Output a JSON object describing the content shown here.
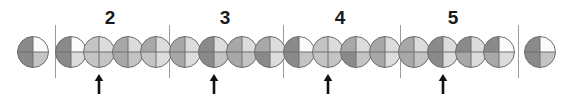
{
  "figure": {
    "width": 574,
    "height": 102,
    "background": "#ffffff"
  },
  "palette": {
    "outline": "#6e6e6e",
    "separator": "#9a9a9a",
    "arrow": "#111111",
    "label": "#1a1a1a",
    "shades": {
      "dark": "#8a8a8a",
      "mid": "#a8a8a8",
      "light": "#c4c4c4",
      "pale": "#dcdcdc",
      "white": "#fbfbfb"
    }
  },
  "geometry": {
    "circle_radius": 15.5,
    "circle_center_y": 52,
    "separator_top": 25,
    "separator_bottom": 78,
    "label_y": 8,
    "arrow_y": 74,
    "arrow_height": 20
  },
  "separators": [
    {
      "name": "separator-1",
      "x": 55
    },
    {
      "name": "separator-2",
      "x": 169
    },
    {
      "name": "separator-3",
      "x": 283
    },
    {
      "name": "separator-4",
      "x": 400
    },
    {
      "name": "separator-5",
      "x": 518
    }
  ],
  "group_labels": [
    {
      "name": "group-label-2",
      "text": "2",
      "x": 110
    },
    {
      "name": "group-label-3",
      "text": "3",
      "x": 225
    },
    {
      "name": "group-label-4",
      "text": "4",
      "x": 340
    },
    {
      "name": "group-label-5",
      "text": "5",
      "x": 453
    }
  ],
  "arrows": [
    {
      "name": "arrow-group-2",
      "x": 99,
      "glyph": "up-arrow"
    },
    {
      "name": "arrow-group-3",
      "x": 214,
      "glyph": "up-arrow"
    },
    {
      "name": "arrow-group-4",
      "x": 328,
      "glyph": "up-arrow"
    },
    {
      "name": "arrow-group-5",
      "x": 443,
      "glyph": "up-arrow"
    }
  ],
  "circles": [
    {
      "index": 1,
      "x": 33,
      "quadrants": {
        "tl": "#8a8a8a",
        "tr": "#fbfbfb",
        "br": "#c4c4c4",
        "bl": "#8a8a8a"
      }
    },
    {
      "index": 2,
      "x": 71,
      "quadrants": {
        "tl": "#8a8a8a",
        "tr": "#fbfbfb",
        "br": "#dcdcdc",
        "bl": "#8a8a8a"
      }
    },
    {
      "index": 3,
      "x": 99,
      "quadrants": {
        "tl": "#c4c4c4",
        "tr": "#dcdcdc",
        "br": "#c4c4c4",
        "bl": "#c4c4c4"
      }
    },
    {
      "index": 4,
      "x": 128,
      "quadrants": {
        "tl": "#a8a8a8",
        "tr": "#dcdcdc",
        "br": "#c4c4c4",
        "bl": "#a8a8a8"
      }
    },
    {
      "index": 5,
      "x": 156,
      "quadrants": {
        "tl": "#a8a8a8",
        "tr": "#dcdcdc",
        "br": "#dcdcdc",
        "bl": "#c4c4c4"
      }
    },
    {
      "index": 6,
      "x": 185,
      "quadrants": {
        "tl": "#a8a8a8",
        "tr": "#dcdcdc",
        "br": "#dcdcdc",
        "bl": "#a8a8a8"
      }
    },
    {
      "index": 7,
      "x": 214,
      "quadrants": {
        "tl": "#8a8a8a",
        "tr": "#dcdcdc",
        "br": "#c4c4c4",
        "bl": "#8a8a8a"
      }
    },
    {
      "index": 8,
      "x": 242,
      "quadrants": {
        "tl": "#a8a8a8",
        "tr": "#dcdcdc",
        "br": "#c4c4c4",
        "bl": "#a8a8a8"
      }
    },
    {
      "index": 9,
      "x": 270,
      "quadrants": {
        "tl": "#a8a8a8",
        "tr": "#dcdcdc",
        "br": "#dcdcdc",
        "bl": "#8a8a8a"
      }
    },
    {
      "index": 10,
      "x": 299,
      "quadrants": {
        "tl": "#8a8a8a",
        "tr": "#fbfbfb",
        "br": "#c4c4c4",
        "bl": "#8a8a8a"
      }
    },
    {
      "index": 11,
      "x": 328,
      "quadrants": {
        "tl": "#c4c4c4",
        "tr": "#dcdcdc",
        "br": "#c4c4c4",
        "bl": "#c4c4c4"
      }
    },
    {
      "index": 12,
      "x": 356,
      "quadrants": {
        "tl": "#a8a8a8",
        "tr": "#dcdcdc",
        "br": "#c4c4c4",
        "bl": "#8a8a8a"
      }
    },
    {
      "index": 13,
      "x": 385,
      "quadrants": {
        "tl": "#a8a8a8",
        "tr": "#dcdcdc",
        "br": "#dcdcdc",
        "bl": "#a8a8a8"
      }
    },
    {
      "index": 14,
      "x": 414,
      "quadrants": {
        "tl": "#a8a8a8",
        "tr": "#dcdcdc",
        "br": "#c4c4c4",
        "bl": "#a8a8a8"
      }
    },
    {
      "index": 15,
      "x": 443,
      "quadrants": {
        "tl": "#8a8a8a",
        "tr": "#dcdcdc",
        "br": "#dcdcdc",
        "bl": "#8a8a8a"
      }
    },
    {
      "index": 16,
      "x": 471,
      "quadrants": {
        "tl": "#8a8a8a",
        "tr": "#dcdcdc",
        "br": "#dcdcdc",
        "bl": "#a8a8a8"
      }
    },
    {
      "index": 17,
      "x": 499,
      "quadrants": {
        "tl": "#8a8a8a",
        "tr": "#fbfbfb",
        "br": "#dcdcdc",
        "bl": "#a8a8a8"
      }
    },
    {
      "index": 18,
      "x": 540,
      "quadrants": {
        "tl": "#8a8a8a",
        "tr": "#fbfbfb",
        "br": "#c4c4c4",
        "bl": "#8a8a8a"
      }
    }
  ]
}
